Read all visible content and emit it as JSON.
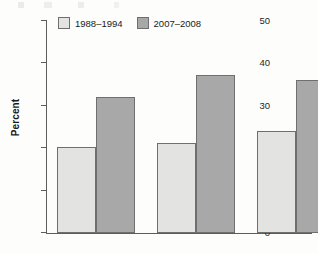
{
  "chart_data": {
    "type": "bar",
    "title": "",
    "subtitle": "",
    "xlabel": "",
    "ylabel": "Percent",
    "ylim": [
      0,
      50
    ],
    "yticks": [
      0,
      10,
      20,
      30,
      40,
      50
    ],
    "ytick_labels": [
      "0",
      "10",
      "20",
      "30",
      "40",
      "50"
    ],
    "grid": false,
    "legend_position": "top-left",
    "categories": [
      "",
      "",
      ""
    ],
    "xtick_labels": [
      "",
      "",
      ""
    ],
    "series": [
      {
        "name": "1988–1994",
        "color": "#e3e3e1",
        "values": [
          20.4,
          21.2,
          24.0
        ]
      },
      {
        "name": "2007–2008",
        "color": "#a8a8a8",
        "values": [
          32.0,
          37.2,
          36.0
        ]
      }
    ]
  },
  "axis": {
    "y_label": "Percent"
  },
  "legend": {
    "items": [
      {
        "label": "1988–1994",
        "color": "#e3e3e1"
      },
      {
        "label": "2007–2008",
        "color": "#a8a8a8"
      }
    ]
  },
  "style": {
    "axis_color": "#5d5d5d",
    "bar_border": "#6f6f6f",
    "background": "#fdfdfc"
  }
}
